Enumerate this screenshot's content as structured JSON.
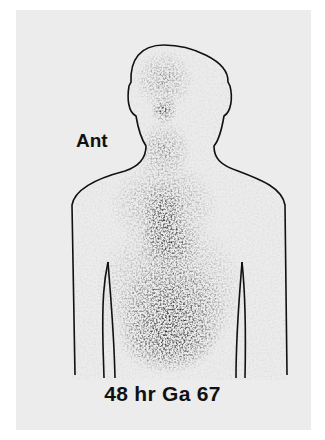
{
  "figure": {
    "view_label": "Ant",
    "caption": "48 hr Ga 67",
    "colors": {
      "background": "#ffffff",
      "plate": "#ececec",
      "outline": "#111111",
      "uptake": "#1a1a1a"
    }
  }
}
